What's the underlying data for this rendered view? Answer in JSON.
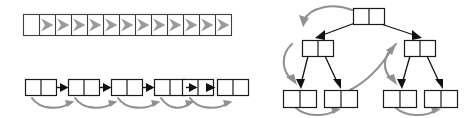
{
  "figure": {
    "background_color": "#ffffff",
    "width": 473,
    "height": 118,
    "panels": [
      {
        "id": "array-panel",
        "name": "array-sequential-traversal",
        "label": "",
        "kind": "array",
        "cell_count": 13,
        "arrow_count": 12,
        "arrow_color": "#9a9a9a",
        "box_color": "#404040",
        "fill_color": "#ffffff",
        "cells": [
          "",
          "",
          "",
          "",
          "",
          "",
          "",
          "",
          "",
          "",
          "",
          "",
          ""
        ],
        "geometry": {
          "x": 23,
          "y": 14,
          "width": 208,
          "height": 22,
          "cell_width": 16
        }
      },
      {
        "id": "linked-list-panel",
        "name": "linked-list-traversal",
        "label": "",
        "kind": "linked-list",
        "node_count": 6,
        "cells_per_node": 2,
        "link_arrow_count": 5,
        "curve_arrow_count": 5,
        "link_color": "#111111",
        "curve_color": "#919191",
        "box_color": "#1a1a1a",
        "nodes": [
          {
            "data": "",
            "next": ""
          },
          {
            "data": "",
            "next": ""
          },
          {
            "data": "",
            "next": ""
          },
          {
            "data": "",
            "next": ""
          },
          {
            "data": "",
            "next": ""
          },
          {
            "data": "",
            "next": ""
          }
        ],
        "geometry": {
          "x": 25,
          "y": 79,
          "node_width": 31,
          "node_height": 16,
          "gap": 6
        }
      },
      {
        "id": "tree-panel",
        "name": "binary-tree-traversal",
        "label": "",
        "kind": "binary-tree",
        "node_count": 7,
        "cells_per_node": 2,
        "levels": 3,
        "edge_color": "#111111",
        "curve_color": "#919191",
        "box_color": "#1a1a1a",
        "nodes": [
          {
            "id": "root",
            "level": 0,
            "label": "",
            "x": 353,
            "y": 8
          },
          {
            "id": "left",
            "level": 1,
            "label": "",
            "x": 302,
            "y": 40
          },
          {
            "id": "right",
            "level": 1,
            "label": "",
            "x": 404,
            "y": 40
          },
          {
            "id": "leaf1",
            "level": 2,
            "label": "",
            "x": 283,
            "y": 90
          },
          {
            "id": "leaf2",
            "level": 2,
            "label": "",
            "x": 324,
            "y": 90
          },
          {
            "id": "leaf3",
            "level": 2,
            "label": "",
            "x": 383,
            "y": 90
          },
          {
            "id": "leaf4",
            "level": 2,
            "label": "",
            "x": 424,
            "y": 90
          }
        ],
        "edges": [
          {
            "from": "root",
            "to": "left"
          },
          {
            "from": "root",
            "to": "right"
          },
          {
            "from": "left",
            "to": "leaf1"
          },
          {
            "from": "left",
            "to": "leaf2"
          },
          {
            "from": "right",
            "to": "leaf3"
          },
          {
            "from": "right",
            "to": "leaf4"
          }
        ],
        "traversal_curves": 6
      }
    ]
  }
}
